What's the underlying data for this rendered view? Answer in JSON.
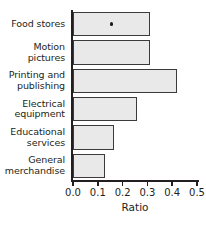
{
  "chart_data": {
    "type": "bar",
    "orientation": "horizontal",
    "title": "",
    "xlabel": "Ratio",
    "ylabel": "",
    "xlim": [
      0.0,
      0.5
    ],
    "xticks": [
      "0.0",
      "0.1",
      "0.2",
      "0.3",
      "0.4",
      "0.5"
    ],
    "xtick_values": [
      0.0,
      0.1,
      0.2,
      0.3,
      0.4,
      0.5
    ],
    "grid": false,
    "legend": "none",
    "categories": [
      "Food stores",
      "Motion\npictures",
      "Printing and\npublishing",
      "Electrical\nequipment",
      "Educational\nservices",
      "General\nmerchandise"
    ],
    "values": [
      0.31,
      0.31,
      0.42,
      0.26,
      0.165,
      0.128
    ],
    "annotations": [
      {
        "name": "point-marker",
        "series_index": 0,
        "category": "Food stores",
        "x": 0.155,
        "shape": "dot"
      }
    ],
    "colors": {
      "bar_fill": "#e9e9e9",
      "bar_edge": "#3b3b3b",
      "axis": "#231f20",
      "text": "#231f20",
      "marker": "#1a1a1a",
      "background": "#ffffff"
    }
  }
}
